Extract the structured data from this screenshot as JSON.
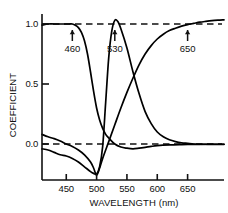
{
  "chart_data": {
    "type": "line",
    "title": "",
    "xlabel": "WAVELENGTH (nm)",
    "ylabel": "COEFFICIENT",
    "xlim": [
      410,
      710
    ],
    "ylim": [
      -0.32,
      1.12
    ],
    "xticks": [
      450,
      500,
      550,
      600,
      650
    ],
    "xtick_labels": [
      "450",
      "500",
      "550",
      "600",
      "650"
    ],
    "yticks": [
      0.0,
      0.5,
      1.0
    ],
    "ytick_labels": [
      "0.0",
      "0.5",
      "1.0"
    ],
    "grid": false,
    "legend": "none",
    "reference_lines": [
      {
        "name": "unity-dashed-line",
        "y": 1.0,
        "style": "dashed"
      },
      {
        "name": "zero-dashed-line",
        "y": 0.0,
        "style": "dashed"
      }
    ],
    "annotations": [
      {
        "name": "arrow-460",
        "label": "460",
        "x": 460,
        "y": 1.0,
        "marker": "up-arrow"
      },
      {
        "name": "arrow-530",
        "label": "530",
        "x": 530,
        "y": 1.0,
        "marker": "up-arrow"
      },
      {
        "name": "arrow-650",
        "label": "650",
        "x": 650,
        "y": 1.0,
        "marker": "up-arrow"
      }
    ],
    "series": [
      {
        "name": "blue-primary-coefficient",
        "color": "#000000",
        "x": [
          410,
          420,
          430,
          440,
          450,
          455,
          460,
          465,
          470,
          475,
          480,
          485,
          490,
          495,
          500,
          505,
          510,
          515,
          520,
          530,
          540,
          550,
          560,
          570,
          580,
          590,
          600,
          620,
          640,
          660,
          680,
          700,
          710
        ],
        "y": [
          0.99,
          1.0,
          1.0,
          1.0,
          1.0,
          1.0,
          1.0,
          0.99,
          0.97,
          0.93,
          0.86,
          0.75,
          0.6,
          0.44,
          0.3,
          0.2,
          0.13,
          0.08,
          0.05,
          0.0,
          -0.025,
          -0.035,
          -0.04,
          -0.035,
          -0.028,
          -0.02,
          -0.014,
          -0.008,
          -0.005,
          -0.003,
          -0.002,
          -0.002,
          -0.002
        ]
      },
      {
        "name": "green-primary-coefficient",
        "color": "#000000",
        "x": [
          410,
          420,
          430,
          440,
          450,
          460,
          470,
          480,
          490,
          495,
          500,
          505,
          510,
          515,
          520,
          525,
          530,
          535,
          540,
          550,
          560,
          570,
          580,
          590,
          600,
          610,
          620,
          630,
          640,
          650,
          660,
          670,
          690,
          710
        ],
        "y": [
          -0.04,
          -0.05,
          -0.07,
          -0.09,
          -0.1,
          -0.12,
          -0.15,
          -0.19,
          -0.23,
          -0.245,
          -0.25,
          -0.19,
          -0.02,
          0.35,
          0.72,
          0.94,
          1.03,
          1.02,
          0.96,
          0.8,
          0.6,
          0.42,
          0.27,
          0.17,
          0.1,
          0.06,
          0.035,
          0.02,
          0.01,
          0.005,
          0.0,
          -0.002,
          -0.003,
          -0.003
        ]
      },
      {
        "name": "red-primary-coefficient",
        "color": "#000000",
        "x": [
          410,
          420,
          430,
          440,
          450,
          460,
          470,
          480,
          490,
          495,
          500,
          505,
          510,
          520,
          530,
          540,
          550,
          560,
          570,
          580,
          590,
          600,
          610,
          620,
          630,
          640,
          650,
          660,
          670,
          680,
          690,
          700,
          710
        ],
        "y": [
          0.08,
          0.06,
          0.045,
          0.025,
          0.0,
          -0.02,
          -0.05,
          -0.09,
          -0.15,
          -0.2,
          -0.26,
          -0.2,
          -0.12,
          0.02,
          0.16,
          0.3,
          0.43,
          0.55,
          0.66,
          0.75,
          0.82,
          0.875,
          0.915,
          0.945,
          0.965,
          0.982,
          0.995,
          1.005,
          1.015,
          1.022,
          1.028,
          1.032,
          1.035
        ]
      }
    ]
  },
  "axes": {
    "y_label_text": "COEFFICIENT",
    "x_label_text": "WAVELENGTH (nm)"
  }
}
